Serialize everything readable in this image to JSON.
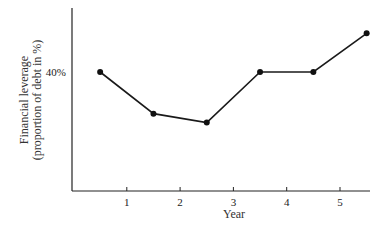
{
  "chart_data": {
    "type": "line",
    "title": "",
    "xlabel": "Year",
    "ylabel": "Financial leverage (proportion of debt in %)",
    "ylabel_lines": [
      "Financial leverage",
      "(proportion of debt in %)"
    ],
    "x_ticks": [
      "1",
      "2",
      "3",
      "4",
      "5"
    ],
    "y_ticks": [
      "40%"
    ],
    "x": [
      0.5,
      1.5,
      2.5,
      3.5,
      4.5,
      5.5
    ],
    "series": [
      {
        "name": "Financial leverage",
        "values": [
          40,
          26,
          23,
          40,
          40,
          53
        ]
      }
    ],
    "xlim": [
      0,
      5.6
    ],
    "ylim": [
      0,
      62
    ],
    "grid": false,
    "legend": "none"
  }
}
